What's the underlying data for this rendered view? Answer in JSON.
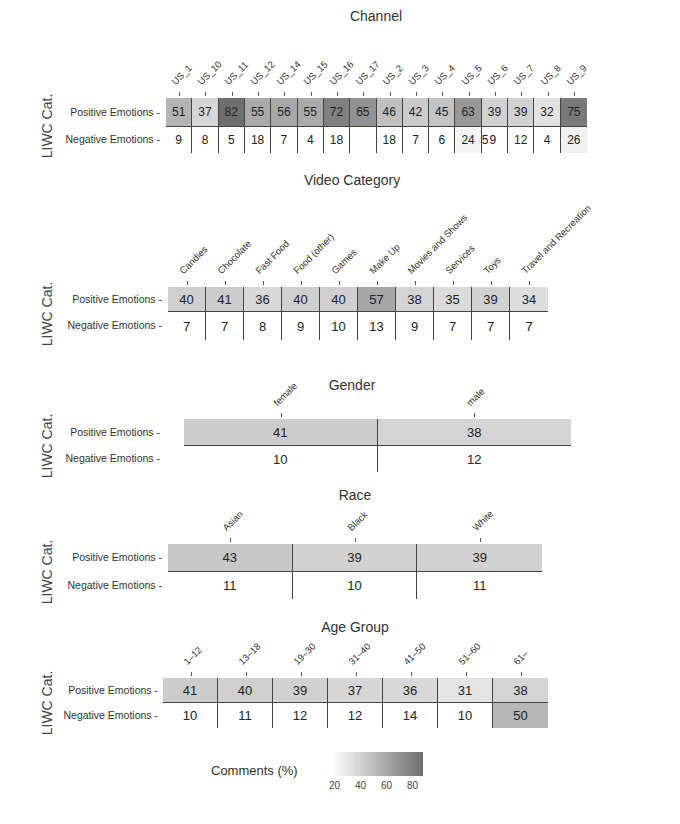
{
  "chart_data": [
    {
      "type": "heatmap",
      "title": "Channel",
      "ylabel": "LIWC Cat.",
      "rows": [
        "Positive Emotions",
        "Negative Emotions"
      ],
      "categories": [
        "US_1",
        "US_10",
        "US_11",
        "US_12",
        "US_14",
        "US_15",
        "US_16",
        "US_17",
        "US_2",
        "US_3",
        "US_4",
        "US_5",
        "US_6",
        "US_7",
        "US_8",
        "US_9"
      ],
      "values": [
        [
          51,
          37,
          82,
          55,
          56,
          55,
          72,
          65,
          46,
          42,
          45,
          63,
          39,
          39,
          32,
          75
        ],
        [
          9,
          8,
          5,
          18,
          7,
          4,
          18,
          null,
          18,
          7,
          6,
          24,
          9,
          12,
          4,
          26
        ]
      ],
      "display": [
        [
          "51",
          "37",
          "82",
          "55",
          "56",
          "55",
          "72",
          "65",
          "46",
          "42",
          "45",
          "63",
          "39",
          "39",
          "32",
          "75"
        ],
        [
          "9",
          "8",
          "5",
          "18",
          "7",
          "4",
          "18",
          "",
          "18",
          "7",
          "6",
          "24",
          "59",
          "12",
          "4",
          "26"
        ]
      ]
    },
    {
      "type": "heatmap",
      "title": "Video Category",
      "ylabel": "LIWC Cat.",
      "rows": [
        "Positive Emotions",
        "Negative Emotions"
      ],
      "categories": [
        "Candies",
        "Chocolate",
        "Fast Food",
        "Food (other)",
        "Games",
        "Make Up",
        "Movies and Shows",
        "Services",
        "Toys",
        "Travel and Recreation"
      ],
      "values": [
        [
          40,
          41,
          36,
          40,
          40,
          57,
          38,
          35,
          39,
          34
        ],
        [
          7,
          7,
          8,
          9,
          10,
          13,
          9,
          7,
          7,
          7
        ]
      ]
    },
    {
      "type": "heatmap",
      "title": "Gender",
      "ylabel": "LIWC Cat.",
      "rows": [
        "Positive Emotions",
        "Negative Emotions"
      ],
      "categories": [
        "female",
        "male"
      ],
      "values": [
        [
          41,
          38
        ],
        [
          10,
          12
        ]
      ]
    },
    {
      "type": "heatmap",
      "title": "Race",
      "ylabel": "LIWC Cat.",
      "rows": [
        "Positive Emotions",
        "Negative Emotions"
      ],
      "categories": [
        "Asian",
        "Black",
        "White"
      ],
      "values": [
        [
          43,
          39,
          39
        ],
        [
          11,
          10,
          11
        ]
      ]
    },
    {
      "type": "heatmap",
      "title": "Age Group",
      "ylabel": "LIWC Cat.",
      "rows": [
        "Positive Emotions",
        "Negative Emotions"
      ],
      "categories": [
        "1-12",
        "13-18",
        "19-30",
        "31-40",
        "41-50",
        "51-60",
        "61-"
      ],
      "values": [
        [
          41,
          40,
          39,
          37,
          36,
          31,
          38
        ],
        [
          10,
          11,
          12,
          12,
          14,
          10,
          50
        ]
      ]
    }
  ],
  "legend": {
    "title": "Comments (%)",
    "ticks": [
      "20",
      "40",
      "60",
      "80"
    ],
    "range": [
      20,
      80
    ],
    "color_low": "#ffffff",
    "color_high": "#6e6e6e"
  }
}
